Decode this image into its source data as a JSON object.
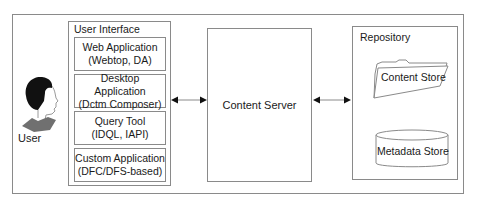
{
  "diagram": {
    "user": {
      "label": "User",
      "icon": "user-profile-icon"
    },
    "user_interface": {
      "title": "User Interface",
      "apps": [
        {
          "line1": "Web Application",
          "line2": "(Webtop, DA)"
        },
        {
          "line1": "Desktop Application",
          "line2": "(Dctm Composer)"
        },
        {
          "line1": "Query Tool",
          "line2": "(IDQL, IAPI)"
        },
        {
          "line1": "Custom Application",
          "line2": "(DFC/DFS-based)"
        }
      ]
    },
    "content_server": {
      "label": "Content Server"
    },
    "repository": {
      "title": "Repository",
      "content_store": {
        "label": "Content Store",
        "icon": "folder-icon"
      },
      "metadata_store": {
        "label": "Metadata Store",
        "icon": "database-cylinder-icon"
      }
    },
    "connectors": [
      {
        "from": "User Interface",
        "to": "Content Server",
        "type": "bidirectional-arrow"
      },
      {
        "from": "Content Server",
        "to": "Repository",
        "type": "bidirectional-arrow"
      }
    ],
    "colors": {
      "border": "#8a8a8a",
      "text": "#1a1a1a",
      "figure_hair": "#111111",
      "figure_collar": "#707070"
    }
  }
}
